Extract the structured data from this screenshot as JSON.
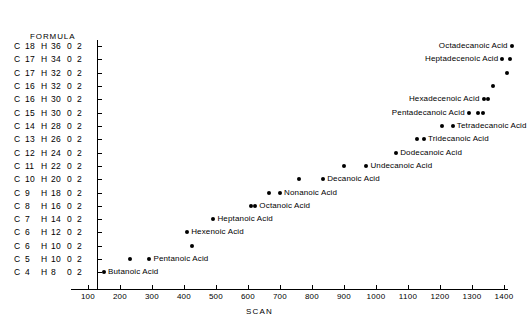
{
  "axes": {
    "y_header": "FORMULA",
    "x_title": "SCAN",
    "x_ticks": [
      100,
      200,
      300,
      400,
      500,
      600,
      700,
      800,
      900,
      1000,
      1100,
      1200,
      1300,
      1400
    ]
  },
  "formulas": [
    {
      "c": "C",
      "cn": "18",
      "h": "H",
      "hn": "36",
      "o": "0",
      "o2": "2"
    },
    {
      "c": "C",
      "cn": "17",
      "h": "H",
      "hn": "34",
      "o": "0",
      "o2": "2"
    },
    {
      "c": "C",
      "cn": "17",
      "h": "H",
      "hn": "32",
      "o": "0",
      "o2": "2"
    },
    {
      "c": "C",
      "cn": "16",
      "h": "H",
      "hn": "32",
      "o": "0",
      "o2": "2"
    },
    {
      "c": "C",
      "cn": "16",
      "h": "H",
      "hn": "30",
      "o": "0",
      "o2": "2"
    },
    {
      "c": "C",
      "cn": "15",
      "h": "H",
      "hn": "30",
      "o": "0",
      "o2": "2"
    },
    {
      "c": "C",
      "cn": "14",
      "h": "H",
      "hn": "28",
      "o": "0",
      "o2": "2"
    },
    {
      "c": "C",
      "cn": "13",
      "h": "H",
      "hn": "26",
      "o": "0",
      "o2": "2"
    },
    {
      "c": "C",
      "cn": "12",
      "h": "H",
      "hn": "24",
      "o": "0",
      "o2": "2"
    },
    {
      "c": "C",
      "cn": "11",
      "h": "H",
      "hn": "22",
      "o": "0",
      "o2": "2"
    },
    {
      "c": "C",
      "cn": "10",
      "h": "H",
      "hn": "20",
      "o": "0",
      "o2": "2"
    },
    {
      "c": "C",
      "cn": "9",
      "h": "H",
      "hn": "18",
      "o": "0",
      "o2": "2"
    },
    {
      "c": "C",
      "cn": "8",
      "h": "H",
      "hn": "16",
      "o": "0",
      "o2": "2"
    },
    {
      "c": "C",
      "cn": "7",
      "h": "H",
      "hn": "14",
      "o": "0",
      "o2": "2"
    },
    {
      "c": "C",
      "cn": "6",
      "h": "H",
      "hn": "12",
      "o": "0",
      "o2": "2"
    },
    {
      "c": "C",
      "cn": "6",
      "h": "H",
      "hn": "10",
      "o": "0",
      "o2": "2"
    },
    {
      "c": "C",
      "cn": "5",
      "h": "H",
      "hn": "10",
      "o": "0",
      "o2": "2"
    },
    {
      "c": "C",
      "cn": "4",
      "h": "H",
      "hn": "8",
      "o": "0",
      "o2": "2"
    }
  ],
  "chart_data": {
    "type": "scatter",
    "title": "",
    "xlabel": "SCAN",
    "ylabel": "FORMULA",
    "xlim": [
      60,
      1470
    ],
    "grid": false,
    "legend": "none",
    "y_categories": [
      "C18 H36 0 2",
      "C17 H34 0 2",
      "C17 H32 0 2",
      "C16 H32 0 2",
      "C16 H30 0 2",
      "C15 H30 0 2",
      "C14 H28 0 2",
      "C13 H26 0 2",
      "C12 H24 0 2",
      "C11 H22 0 2",
      "C10 H20 0 2",
      "C9 H18 0 2",
      "C8 H16 0 2",
      "C7 H14 0 2",
      "C6 H12 0 2",
      "C6 H10 0 2",
      "C5 H10 0 2",
      "C4 H8 0 2"
    ],
    "points": [
      {
        "row": 0,
        "scan": 1424,
        "label": "Octadecanoic Acid",
        "label_side": "left"
      },
      {
        "row": 1,
        "scan": 1395,
        "label": "Heptadecenoic Acid",
        "label_side": "left"
      },
      {
        "row": 1,
        "scan": 1419,
        "label": "",
        "label_side": "right"
      },
      {
        "row": 2,
        "scan": 1408,
        "label": "",
        "label_side": "right"
      },
      {
        "row": 3,
        "scan": 1365,
        "label": "",
        "label_side": "right"
      },
      {
        "row": 4,
        "scan": 1336,
        "label": "Hexadecenoic Acid",
        "label_side": "left"
      },
      {
        "row": 4,
        "scan": 1350,
        "label": "",
        "label_side": "right"
      },
      {
        "row": 5,
        "scan": 1290,
        "label": "Pentadecanoic Acid",
        "label_side": "left"
      },
      {
        "row": 5,
        "scan": 1320,
        "label": "",
        "label_side": "right"
      },
      {
        "row": 5,
        "scan": 1334,
        "label": "",
        "label_side": "right"
      },
      {
        "row": 6,
        "scan": 1205,
        "label": "",
        "label_side": "right"
      },
      {
        "row": 6,
        "scan": 1240,
        "label": "Tetradecanoic Acid",
        "label_side": "right"
      },
      {
        "row": 7,
        "scan": 1127,
        "label": "",
        "label_side": "right"
      },
      {
        "row": 7,
        "scan": 1150,
        "label": "Tridecanoic Acid",
        "label_side": "right"
      },
      {
        "row": 8,
        "scan": 1063,
        "label": "Dodecanoic Acid",
        "label_side": "right"
      },
      {
        "row": 9,
        "scan": 900,
        "label": "",
        "label_side": "right"
      },
      {
        "row": 9,
        "scan": 970,
        "label": "Undecanoic Acid",
        "label_side": "right"
      },
      {
        "row": 10,
        "scan": 760,
        "label": "",
        "label_side": "right"
      },
      {
        "row": 10,
        "scan": 835,
        "label": "Decanoic Acid",
        "label_side": "right"
      },
      {
        "row": 11,
        "scan": 665,
        "label": "",
        "label_side": "right"
      },
      {
        "row": 11,
        "scan": 700,
        "label": "Nonanoic Acid",
        "label_side": "right"
      },
      {
        "row": 12,
        "scan": 610,
        "label": "",
        "label_side": "right"
      },
      {
        "row": 12,
        "scan": 623,
        "label": "Octanoic Acid",
        "label_side": "right"
      },
      {
        "row": 13,
        "scan": 492,
        "label": "Heptanoic Acid",
        "label_side": "right"
      },
      {
        "row": 14,
        "scan": 410,
        "label": "Hexenoic Acid",
        "label_side": "right"
      },
      {
        "row": 15,
        "scan": 424,
        "label": "",
        "label_side": "right"
      },
      {
        "row": 16,
        "scan": 230,
        "label": "",
        "label_side": "right"
      },
      {
        "row": 16,
        "scan": 292,
        "label": "Pentanoic Acid",
        "label_side": "right"
      },
      {
        "row": 17,
        "scan": 150,
        "label": "Butanoic Acid",
        "label_side": "right"
      }
    ]
  }
}
